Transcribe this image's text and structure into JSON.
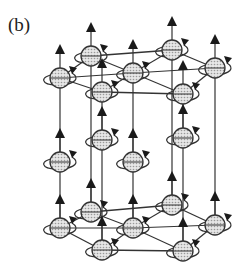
{
  "figure": {
    "panel_label": "(b)"
  },
  "colors": {
    "line": "#333333",
    "sphere_fill": "#d4d4d4",
    "arrow": "#1a1a1a"
  },
  "lattice": {
    "layers": [
      {
        "name": "top",
        "sites": [
          [
            60,
            78
          ],
          [
            91,
            56
          ],
          [
            102,
            92
          ],
          [
            133,
            73
          ],
          [
            172,
            50
          ],
          [
            215,
            68
          ],
          [
            183,
            94
          ]
        ]
      },
      {
        "name": "middle",
        "sites": [
          [
            60,
            162
          ],
          [
            102,
            140
          ],
          [
            133,
            162
          ],
          [
            183,
            138
          ]
        ]
      },
      {
        "name": "bottom",
        "sites": [
          [
            60,
            228
          ],
          [
            91,
            212
          ],
          [
            102,
            250
          ],
          [
            133,
            228
          ],
          [
            172,
            205
          ],
          [
            215,
            225
          ],
          [
            183,
            251
          ]
        ]
      }
    ]
  }
}
